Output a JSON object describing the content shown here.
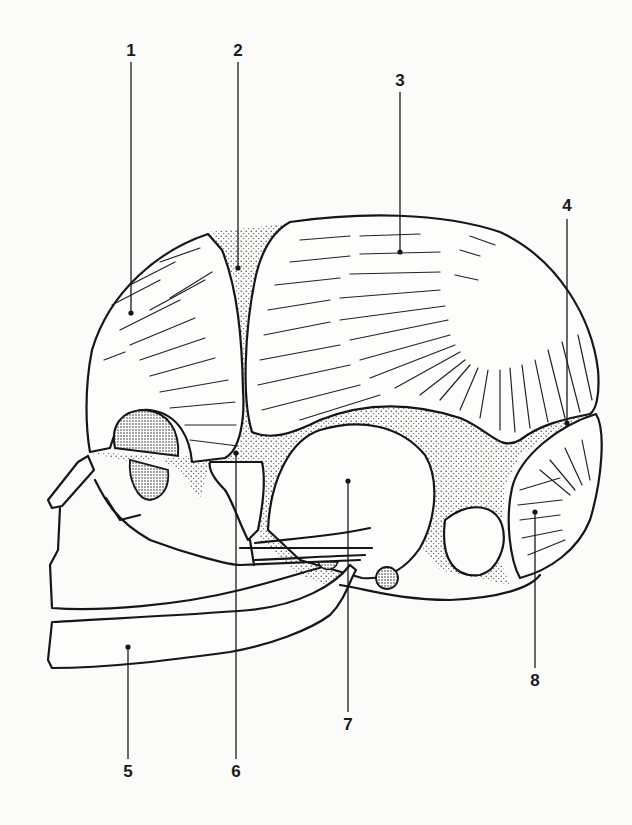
{
  "figure": {
    "background": "#fbfbfa",
    "ink": "#161616"
  },
  "labels": [
    {
      "id": "1",
      "text": "1",
      "x": 131,
      "y": 42,
      "line_x": 131,
      "line_top": 62,
      "dot_y": 313
    },
    {
      "id": "2",
      "text": "2",
      "x": 238,
      "y": 42,
      "line_x": 238,
      "line_top": 62,
      "dot_y": 268
    },
    {
      "id": "3",
      "text": "3",
      "x": 400,
      "y": 72,
      "line_x": 400,
      "line_top": 92,
      "dot_y": 252
    },
    {
      "id": "4",
      "text": "4",
      "x": 567,
      "y": 197,
      "line_x": 567,
      "line_top": 219,
      "dot_y": 423
    },
    {
      "id": "5",
      "text": "5",
      "x": 128,
      "y": 763,
      "line_x": 128,
      "line_top": 647,
      "dot_y": 647
    },
    {
      "id": "6",
      "text": "6",
      "x": 236,
      "y": 763,
      "line_x": 236,
      "line_top": 453,
      "dot_y": 453
    },
    {
      "id": "7",
      "text": "7",
      "x": 348,
      "y": 716,
      "line_x": 348,
      "line_top": 481,
      "dot_y": 481
    },
    {
      "id": "8",
      "text": "8",
      "x": 535,
      "y": 672,
      "line_x": 535,
      "line_top": 512,
      "dot_y": 512
    }
  ]
}
